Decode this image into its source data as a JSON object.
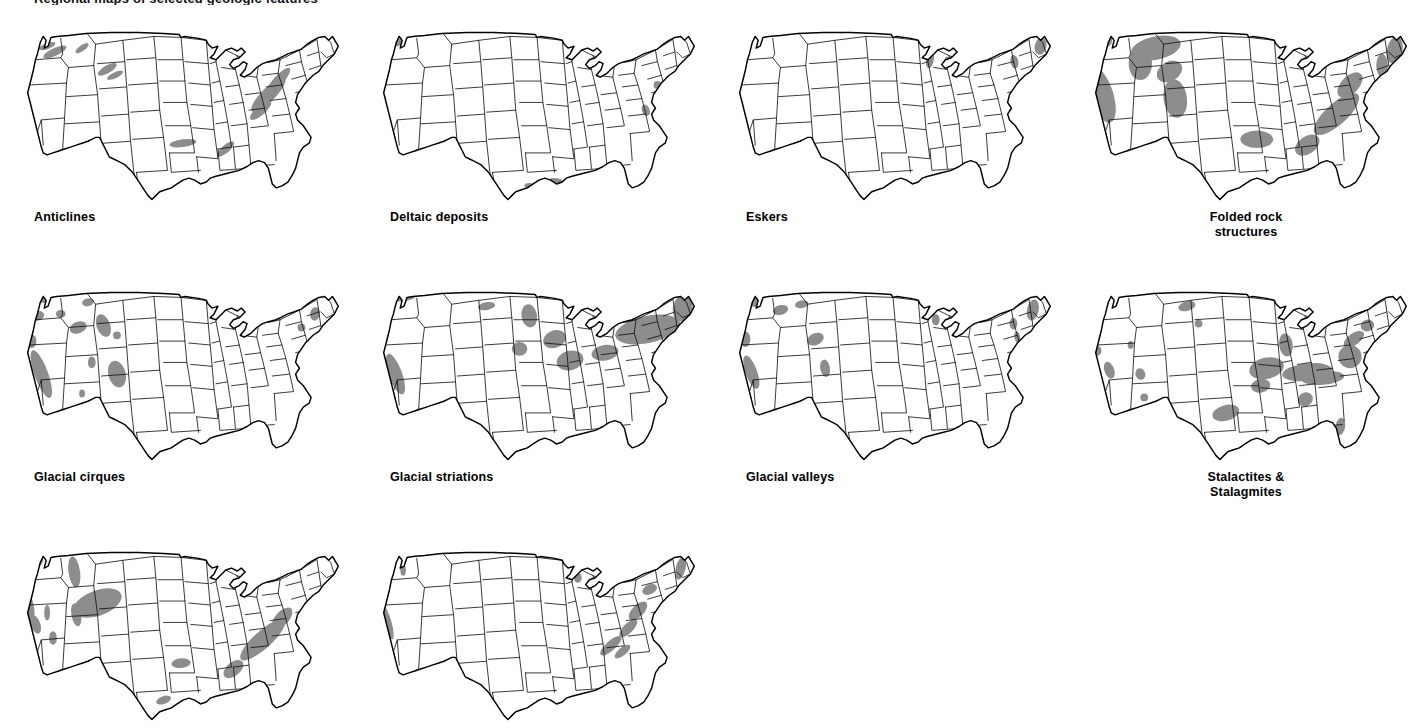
{
  "figure": {
    "title_fragment": "Regional maps of selected geologic features",
    "background_color": "#ffffff",
    "outline_color": "#000000",
    "state_border_color": "#111111",
    "feature_shade_color": "#999999",
    "columns": 4,
    "rows": 3,
    "panel_count": 10
  },
  "maps": [
    {
      "label": "Anticlines",
      "label_align": "left",
      "feature_style": "streaks",
      "shade_color": "#8d8d8d",
      "regions": [
        {
          "name": "pacific-northwest",
          "cx": 38,
          "cy": 28,
          "rx": 13,
          "ry": 4,
          "rot": -25
        },
        {
          "name": "washington-folds",
          "cx": 30,
          "cy": 22,
          "rx": 9,
          "ry": 3,
          "rot": -20
        },
        {
          "name": "idaho-montana",
          "cx": 66,
          "cy": 24,
          "rx": 8,
          "ry": 3,
          "rot": -35
        },
        {
          "name": "western-wyoming",
          "cx": 92,
          "cy": 46,
          "rx": 11,
          "ry": 4,
          "rot": -30
        },
        {
          "name": "wyoming-basin",
          "cx": 100,
          "cy": 52,
          "rx": 9,
          "ry": 3,
          "rot": -25
        },
        {
          "name": "appalachian-valley-ridge",
          "cx": 258,
          "cy": 72,
          "rx": 24,
          "ry": 7,
          "rot": -45
        },
        {
          "name": "pennsylvania-folds",
          "cx": 268,
          "cy": 58,
          "rx": 18,
          "ry": 5,
          "rot": -48
        },
        {
          "name": "virginia-folds",
          "cx": 250,
          "cy": 88,
          "rx": 14,
          "ry": 5,
          "rot": -42
        },
        {
          "name": "arkansas-ouachita",
          "cx": 170,
          "cy": 122,
          "rx": 14,
          "ry": 4,
          "rot": -8
        },
        {
          "name": "alabama-fold-belt",
          "cx": 214,
          "cy": 128,
          "rx": 11,
          "ry": 4,
          "rot": -40
        }
      ]
    },
    {
      "label": "Deltaic deposits",
      "label_align": "left",
      "feature_style": "coastal-patches",
      "shade_color": "#8d8d8d",
      "regions": [
        {
          "name": "puget-sound",
          "cx": 24,
          "cy": 18,
          "rx": 5,
          "ry": 4,
          "rot": 0
        },
        {
          "name": "san-francisco-bay",
          "cx": 7,
          "cy": 76,
          "rx": 5,
          "ry": 5,
          "rot": 0
        },
        {
          "name": "southern-california",
          "cx": 18,
          "cy": 118,
          "rx": 4,
          "ry": 3,
          "rot": 0
        },
        {
          "name": "mississippi-delta",
          "cx": 188,
          "cy": 162,
          "rx": 9,
          "ry": 4,
          "rot": 10
        },
        {
          "name": "texas-gulf-coast",
          "cx": 160,
          "cy": 166,
          "rx": 5,
          "ry": 3,
          "rot": 0
        },
        {
          "name": "chesapeake",
          "cx": 280,
          "cy": 88,
          "rx": 4,
          "ry": 6,
          "rot": -20
        },
        {
          "name": "new-jersey-coast",
          "cx": 292,
          "cy": 62,
          "rx": 4,
          "ry": 4,
          "rot": 0
        }
      ]
    },
    {
      "label": "Eskers",
      "label_align": "left",
      "feature_style": "tiny-patches",
      "shade_color": "#8d8d8d",
      "regions": [
        {
          "name": "wisconsin-upper-michigan",
          "cx": 206,
          "cy": 36,
          "rx": 4,
          "ry": 9,
          "rot": 10
        },
        {
          "name": "michigan-lower",
          "cx": 224,
          "cy": 38,
          "rx": 3,
          "ry": 5,
          "rot": 0
        },
        {
          "name": "maine",
          "cx": 320,
          "cy": 22,
          "rx": 6,
          "ry": 9,
          "rot": 15
        },
        {
          "name": "new-york-adirondack",
          "cx": 293,
          "cy": 38,
          "rx": 4,
          "ry": 7,
          "rot": -10
        },
        {
          "name": "new-england-coast",
          "cx": 315,
          "cy": 46,
          "rx": 4,
          "ry": 3,
          "rot": 0
        }
      ]
    },
    {
      "label": "Folded rock\nstructures",
      "label_align": "center",
      "feature_style": "broad-belts",
      "shade_color": "#8d8d8d",
      "regions": [
        {
          "name": "coast-ranges-california",
          "cx": 16,
          "cy": 72,
          "rx": 12,
          "ry": 30,
          "rot": -18
        },
        {
          "name": "olympic-peninsula",
          "cx": 20,
          "cy": 16,
          "rx": 7,
          "ry": 7,
          "rot": 0
        },
        {
          "name": "northern-rockies-montana",
          "cx": 72,
          "cy": 24,
          "rx": 26,
          "ry": 12,
          "rot": -12
        },
        {
          "name": "idaho-batholith-belt",
          "cx": 56,
          "cy": 40,
          "rx": 12,
          "ry": 17,
          "rot": 0
        },
        {
          "name": "wyoming-overthrust",
          "cx": 86,
          "cy": 48,
          "rx": 14,
          "ry": 10,
          "rot": -30
        },
        {
          "name": "colorado-rockies",
          "cx": 92,
          "cy": 76,
          "rx": 12,
          "ry": 20,
          "rot": -8
        },
        {
          "name": "ouachita-arkansas",
          "cx": 176,
          "cy": 118,
          "rx": 17,
          "ry": 9,
          "rot": 0
        },
        {
          "name": "appalachian-valley-ridge",
          "cx": 258,
          "cy": 92,
          "rx": 30,
          "ry": 11,
          "rot": -42
        },
        {
          "name": "pennsylvania-folds",
          "cx": 272,
          "cy": 62,
          "rx": 16,
          "ry": 9,
          "rot": -45
        },
        {
          "name": "alabama-appalachians",
          "cx": 228,
          "cy": 124,
          "rx": 14,
          "ry": 9,
          "rot": -35
        },
        {
          "name": "new-england-maine",
          "cx": 318,
          "cy": 26,
          "rx": 8,
          "ry": 14,
          "rot": 12
        },
        {
          "name": "vermont-new-hampshire",
          "cx": 305,
          "cy": 42,
          "rx": 6,
          "ry": 12,
          "rot": 0
        }
      ]
    },
    {
      "label": "Glacial cirques",
      "label_align": "left",
      "feature_style": "scattered-blobs",
      "shade_color": "#8d8d8d",
      "regions": [
        {
          "name": "north-cascades",
          "cx": 26,
          "cy": 14,
          "rx": 4,
          "ry": 5,
          "rot": 0
        },
        {
          "name": "olympic-mountains",
          "cx": 20,
          "cy": 32,
          "rx": 7,
          "ry": 5,
          "rot": -15
        },
        {
          "name": "northern-idaho",
          "cx": 44,
          "cy": 30,
          "rx": 5,
          "ry": 4,
          "rot": 0
        },
        {
          "name": "glacier-montana",
          "cx": 72,
          "cy": 18,
          "rx": 6,
          "ry": 4,
          "rot": -10
        },
        {
          "name": "bitterroot",
          "cx": 62,
          "cy": 44,
          "rx": 9,
          "ry": 6,
          "rot": -20
        },
        {
          "name": "wind-river-wyoming",
          "cx": 88,
          "cy": 42,
          "rx": 7,
          "ry": 12,
          "rot": -20
        },
        {
          "name": "bighorn",
          "cx": 102,
          "cy": 52,
          "rx": 4,
          "ry": 4,
          "rot": 0
        },
        {
          "name": "oregon-cascades",
          "cx": 14,
          "cy": 58,
          "rx": 5,
          "ry": 7,
          "rot": 0
        },
        {
          "name": "sierra-nevada",
          "cx": 24,
          "cy": 92,
          "rx": 7,
          "ry": 26,
          "rot": -20
        },
        {
          "name": "utah-wasatch",
          "cx": 76,
          "cy": 80,
          "rx": 4,
          "ry": 6,
          "rot": 0
        },
        {
          "name": "colorado-front-range",
          "cx": 102,
          "cy": 92,
          "rx": 9,
          "ry": 14,
          "rot": -15
        },
        {
          "name": "northern-new-mexico",
          "cx": 66,
          "cy": 112,
          "rx": 3,
          "ry": 4,
          "rot": 0
        },
        {
          "name": "white-mountains",
          "cx": 306,
          "cy": 30,
          "rx": 5,
          "ry": 7,
          "rot": 10
        },
        {
          "name": "adirondacks",
          "cx": 292,
          "cy": 44,
          "rx": 4,
          "ry": 4,
          "rot": 0
        }
      ]
    },
    {
      "label": "Glacial striations",
      "label_align": "left",
      "feature_style": "glaciated-area",
      "shade_color": "#8d8d8d",
      "regions": [
        {
          "name": "northern-washington",
          "cx": 30,
          "cy": 12,
          "rx": 14,
          "ry": 5,
          "rot": -6
        },
        {
          "name": "north-dakota-edge",
          "cx": 116,
          "cy": 22,
          "rx": 9,
          "ry": 4,
          "rot": -10
        },
        {
          "name": "sierra-nevada",
          "cx": 22,
          "cy": 92,
          "rx": 7,
          "ry": 22,
          "rot": -20
        },
        {
          "name": "minnesota",
          "cx": 160,
          "cy": 32,
          "rx": 8,
          "ry": 12,
          "rot": -10
        },
        {
          "name": "wisconsin-driftless-margin",
          "cx": 186,
          "cy": 56,
          "rx": 12,
          "ry": 9,
          "rot": -20
        },
        {
          "name": "iowa-illinois",
          "cx": 150,
          "cy": 66,
          "rx": 8,
          "ry": 7,
          "rot": 0
        },
        {
          "name": "indiana-ohio",
          "cx": 202,
          "cy": 78,
          "rx": 14,
          "ry": 10,
          "rot": -15
        },
        {
          "name": "pennsylvania-ny-border",
          "cx": 238,
          "cy": 70,
          "rx": 14,
          "ry": 8,
          "rot": -10
        },
        {
          "name": "new-york-new-england",
          "cx": 282,
          "cy": 46,
          "rx": 34,
          "ry": 14,
          "rot": -12
        },
        {
          "name": "maine",
          "cx": 318,
          "cy": 24,
          "rx": 10,
          "ry": 14,
          "rot": 12
        }
      ]
    },
    {
      "label": "Glacial valleys",
      "label_align": "left",
      "feature_style": "mountain-blobs",
      "shade_color": "#8d8d8d",
      "regions": [
        {
          "name": "north-cascades",
          "cx": 26,
          "cy": 18,
          "rx": 6,
          "ry": 5,
          "rot": 0
        },
        {
          "name": "northern-idaho",
          "cx": 52,
          "cy": 26,
          "rx": 8,
          "ry": 5,
          "rot": -15
        },
        {
          "name": "glacier-montana",
          "cx": 74,
          "cy": 20,
          "rx": 7,
          "ry": 4,
          "rot": -10
        },
        {
          "name": "oregon-cascades",
          "cx": 16,
          "cy": 56,
          "rx": 5,
          "ry": 8,
          "rot": 0
        },
        {
          "name": "wyoming-ranges",
          "cx": 88,
          "cy": 56,
          "rx": 9,
          "ry": 6,
          "rot": -25
        },
        {
          "name": "sierra-nevada",
          "cx": 22,
          "cy": 90,
          "rx": 6,
          "ry": 18,
          "rot": -20
        },
        {
          "name": "colorado-rockies",
          "cx": 98,
          "cy": 86,
          "rx": 5,
          "ry": 9,
          "rot": -10
        },
        {
          "name": "upper-michigan",
          "cx": 212,
          "cy": 36,
          "rx": 4,
          "ry": 6,
          "rot": 0
        },
        {
          "name": "adirondacks",
          "cx": 292,
          "cy": 40,
          "rx": 4,
          "ry": 6,
          "rot": 0
        },
        {
          "name": "new-hampshire-maine",
          "cx": 312,
          "cy": 26,
          "rx": 6,
          "ry": 11,
          "rot": 12
        },
        {
          "name": "hudson-valley",
          "cx": 296,
          "cy": 54,
          "rx": 3,
          "ry": 6,
          "rot": -10
        }
      ]
    },
    {
      "label": "Stalactites &\nStalagmites",
      "label_align": "center",
      "feature_style": "karst-belts",
      "shade_color": "#8d8d8d",
      "regions": [
        {
          "name": "black-hills",
          "cx": 104,
          "cy": 22,
          "rx": 9,
          "ry": 5,
          "rot": -15
        },
        {
          "name": "south-dakota-wind-cave",
          "cx": 116,
          "cy": 40,
          "rx": 4,
          "ry": 4,
          "rot": 0
        },
        {
          "name": "nevada-caves",
          "cx": 12,
          "cy": 68,
          "rx": 4,
          "ry": 5,
          "rot": 0
        },
        {
          "name": "utah-caves",
          "cx": 46,
          "cy": 62,
          "rx": 3,
          "ry": 4,
          "rot": 0
        },
        {
          "name": "sierra-nevada-caves",
          "cx": 24,
          "cy": 88,
          "rx": 5,
          "ry": 9,
          "rot": -20
        },
        {
          "name": "new-mexico-carlsbad",
          "cx": 56,
          "cy": 92,
          "rx": 5,
          "ry": 6,
          "rot": -20
        },
        {
          "name": "arizona-caverns",
          "cx": 60,
          "cy": 116,
          "rx": 4,
          "ry": 4,
          "rot": 0
        },
        {
          "name": "texas-edwards-plateau",
          "cx": 144,
          "cy": 132,
          "rx": 14,
          "ry": 8,
          "rot": -15
        },
        {
          "name": "missouri-ozarks",
          "cx": 186,
          "cy": 86,
          "rx": 18,
          "ry": 11,
          "rot": -12
        },
        {
          "name": "arkansas-ozarks",
          "cx": 180,
          "cy": 104,
          "rx": 10,
          "ry": 7,
          "rot": -10
        },
        {
          "name": "kentucky-mammoth-cave",
          "cx": 228,
          "cy": 90,
          "rx": 26,
          "ry": 9,
          "rot": -6
        },
        {
          "name": "tennessee-valley",
          "cx": 244,
          "cy": 96,
          "rx": 22,
          "ry": 7,
          "rot": -5
        },
        {
          "name": "indiana-karst",
          "cx": 206,
          "cy": 62,
          "rx": 7,
          "ry": 12,
          "rot": -8
        },
        {
          "name": "virginia-karst",
          "cx": 272,
          "cy": 74,
          "rx": 12,
          "ry": 12,
          "rot": -45
        },
        {
          "name": "pennsylvania-karst",
          "cx": 276,
          "cy": 56,
          "rx": 12,
          "ry": 6,
          "rot": -35
        },
        {
          "name": "new-york-karst",
          "cx": 290,
          "cy": 42,
          "rx": 7,
          "ry": 6,
          "rot": -20
        },
        {
          "name": "alabama-karst",
          "cx": 226,
          "cy": 118,
          "rx": 8,
          "ry": 7,
          "rot": -30
        },
        {
          "name": "florida-karst",
          "cx": 262,
          "cy": 146,
          "rx": 5,
          "ry": 9,
          "rot": 10
        }
      ]
    },
    {
      "label": "",
      "label_align": "left",
      "feature_style": "broad-belts",
      "shade_color": "#8d8d8d",
      "regions": [
        {
          "name": "olympic-peninsula",
          "cx": 20,
          "cy": 16,
          "rx": 6,
          "ry": 6,
          "rot": 0
        },
        {
          "name": "montana-rockies",
          "cx": 58,
          "cy": 28,
          "rx": 6,
          "ry": 16,
          "rot": -8
        },
        {
          "name": "california-coast-range",
          "cx": 10,
          "cy": 62,
          "rx": 6,
          "ry": 16,
          "rot": -15
        },
        {
          "name": "wyoming-basin-arch",
          "cx": 82,
          "cy": 60,
          "rx": 26,
          "ry": 13,
          "rot": -20
        },
        {
          "name": "utah-uplift",
          "cx": 60,
          "cy": 72,
          "rx": 5,
          "ry": 12,
          "rot": -10
        },
        {
          "name": "sierra-nevada",
          "cx": 18,
          "cy": 82,
          "rx": 5,
          "ry": 10,
          "rot": -20
        },
        {
          "name": "nevada-ranges",
          "cx": 30,
          "cy": 70,
          "rx": 3,
          "ry": 8,
          "rot": 0
        },
        {
          "name": "great-basin-south",
          "cx": 36,
          "cy": 96,
          "rx": 4,
          "ry": 7,
          "rot": 0
        },
        {
          "name": "appalachian-belt",
          "cx": 252,
          "cy": 98,
          "rx": 30,
          "ry": 9,
          "rot": -42
        },
        {
          "name": "pennsylvania-folds",
          "cx": 272,
          "cy": 76,
          "rx": 14,
          "ry": 7,
          "rot": -48
        },
        {
          "name": "arkansas-ouachita",
          "cx": 168,
          "cy": 122,
          "rx": 10,
          "ry": 5,
          "rot": -5
        },
        {
          "name": "alabama-belt",
          "cx": 222,
          "cy": 128,
          "rx": 12,
          "ry": 7,
          "rot": -40
        },
        {
          "name": "gulf-coast-strip",
          "cx": 150,
          "cy": 160,
          "rx": 8,
          "ry": 4,
          "rot": -20
        }
      ]
    },
    {
      "label": "",
      "label_align": "left",
      "feature_style": "streaks",
      "shade_color": "#8d8d8d",
      "regions": [
        {
          "name": "washington-cascades",
          "cx": 30,
          "cy": 26,
          "rx": 3,
          "ry": 6,
          "rot": 0
        },
        {
          "name": "sierra-nevada",
          "cx": 14,
          "cy": 80,
          "rx": 4,
          "ry": 18,
          "rot": -16
        },
        {
          "name": "upper-michigan",
          "cx": 210,
          "cy": 34,
          "rx": 4,
          "ry": 5,
          "rot": 0
        },
        {
          "name": "new-york-valleys",
          "cx": 284,
          "cy": 46,
          "rx": 8,
          "ry": 5,
          "rot": -25
        },
        {
          "name": "maine-coast",
          "cx": 316,
          "cy": 24,
          "rx": 5,
          "ry": 12,
          "rot": 14
        },
        {
          "name": "pennsylvania-ridges",
          "cx": 272,
          "cy": 68,
          "rx": 12,
          "ry": 6,
          "rot": -45
        },
        {
          "name": "virginia-ridges",
          "cx": 262,
          "cy": 86,
          "rx": 12,
          "ry": 5,
          "rot": -45
        },
        {
          "name": "tennessee-ridges",
          "cx": 244,
          "cy": 104,
          "rx": 14,
          "ry": 5,
          "rot": -42
        },
        {
          "name": "carolina-ridges",
          "cx": 256,
          "cy": 110,
          "rx": 10,
          "ry": 4,
          "rot": -40
        }
      ]
    }
  ]
}
